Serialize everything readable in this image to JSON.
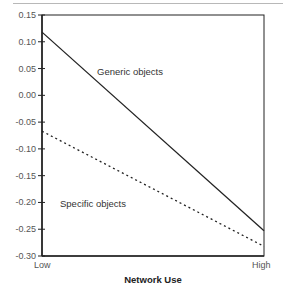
{
  "chart_data": {
    "type": "line",
    "title": "",
    "xlabel": "Network Use",
    "ylabel": "",
    "categories": [
      "Low",
      "High"
    ],
    "x": [
      "Low",
      "High"
    ],
    "ylim": [
      -0.3,
      0.15
    ],
    "yticks": [
      "0.15",
      "0.10",
      "0.05",
      "0.00",
      "-0.05",
      "-0.10",
      "-0.15",
      "-0.20",
      "-0.25",
      "-0.30"
    ],
    "grid": false,
    "legend": "none (inline annotations)",
    "series": [
      {
        "name": "Generic objects",
        "style": "solid",
        "values": [
          0.118,
          -0.253
        ]
      },
      {
        "name": "Specific objects",
        "style": "dotted",
        "values": [
          -0.067,
          -0.282
        ]
      }
    ],
    "annotations": [
      {
        "text": "Generic objects",
        "near": "solid line"
      },
      {
        "text": "Specific objects",
        "near": "dotted line"
      }
    ]
  },
  "labels": {
    "x_low": "Low",
    "x_high": "High",
    "x_axis": "Network Use",
    "generic": "Generic objects",
    "specific": "Specific objects"
  },
  "colors": {
    "line": "#222222",
    "axis": "#222222",
    "text": "#555555"
  }
}
